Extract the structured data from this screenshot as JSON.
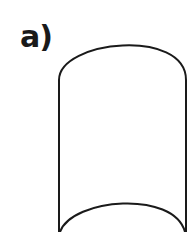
{
  "figure": {
    "label": "a)",
    "shape": "cylinder-outline",
    "stroke_color": "#1a1a1a",
    "background_color": "#ffffff"
  }
}
